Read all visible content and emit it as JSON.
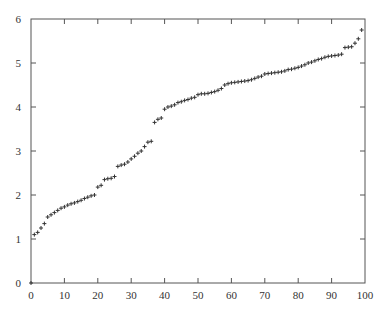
{
  "chart_data": {
    "type": "scatter",
    "title": "",
    "xlabel": "",
    "ylabel": "",
    "xlim": [
      0,
      100
    ],
    "ylim": [
      0,
      6
    ],
    "grid": false,
    "legend": null,
    "marker": "plus",
    "marker_color": "#333333",
    "xticks": [
      0,
      10,
      20,
      30,
      40,
      50,
      60,
      70,
      80,
      90,
      100
    ],
    "yticks": [
      0,
      1,
      2,
      3,
      4,
      5,
      6
    ],
    "xtick_labels": [
      "0",
      "10",
      "20",
      "30",
      "40",
      "50",
      "60",
      "70",
      "80",
      "90",
      "100"
    ],
    "ytick_labels": [
      "0",
      "1",
      "2",
      "3",
      "4",
      "5",
      "6"
    ],
    "series": [
      {
        "name": "sorted values",
        "x": [
          0,
          1,
          2,
          3,
          4,
          5,
          6,
          7,
          8,
          9,
          10,
          11,
          12,
          13,
          14,
          15,
          16,
          17,
          18,
          19,
          20,
          21,
          22,
          23,
          24,
          25,
          26,
          27,
          28,
          29,
          30,
          31,
          32,
          33,
          34,
          35,
          36,
          37,
          38,
          39,
          40,
          41,
          42,
          43,
          44,
          45,
          46,
          47,
          48,
          49,
          50,
          51,
          52,
          53,
          54,
          55,
          56,
          57,
          58,
          59,
          60,
          61,
          62,
          63,
          64,
          65,
          66,
          67,
          68,
          69,
          70,
          71,
          72,
          73,
          74,
          75,
          76,
          77,
          78,
          79,
          80,
          81,
          82,
          83,
          84,
          85,
          86,
          87,
          88,
          89,
          90,
          91,
          92,
          93,
          94,
          95,
          96,
          97,
          98,
          99
        ],
        "y": [
          0,
          1.1,
          1.15,
          1.25,
          1.35,
          1.5,
          1.55,
          1.6,
          1.65,
          1.7,
          1.73,
          1.77,
          1.8,
          1.82,
          1.85,
          1.88,
          1.92,
          1.95,
          1.98,
          2.0,
          2.18,
          2.22,
          2.35,
          2.37,
          2.38,
          2.42,
          2.65,
          2.68,
          2.7,
          2.75,
          2.82,
          2.88,
          2.95,
          3.0,
          3.1,
          3.2,
          3.22,
          3.65,
          3.72,
          3.75,
          3.95,
          4.0,
          4.02,
          4.05,
          4.1,
          4.12,
          4.15,
          4.17,
          4.2,
          4.22,
          4.28,
          4.3,
          4.3,
          4.31,
          4.33,
          4.35,
          4.38,
          4.42,
          4.5,
          4.53,
          4.55,
          4.56,
          4.57,
          4.58,
          4.59,
          4.6,
          4.62,
          4.65,
          4.68,
          4.7,
          4.75,
          4.76,
          4.77,
          4.78,
          4.79,
          4.8,
          4.82,
          4.85,
          4.86,
          4.88,
          4.9,
          4.93,
          4.96,
          5.0,
          5.02,
          5.05,
          5.08,
          5.1,
          5.13,
          5.15,
          5.16,
          5.17,
          5.18,
          5.2,
          5.35,
          5.36,
          5.37,
          5.45,
          5.55,
          5.75
        ]
      }
    ]
  }
}
